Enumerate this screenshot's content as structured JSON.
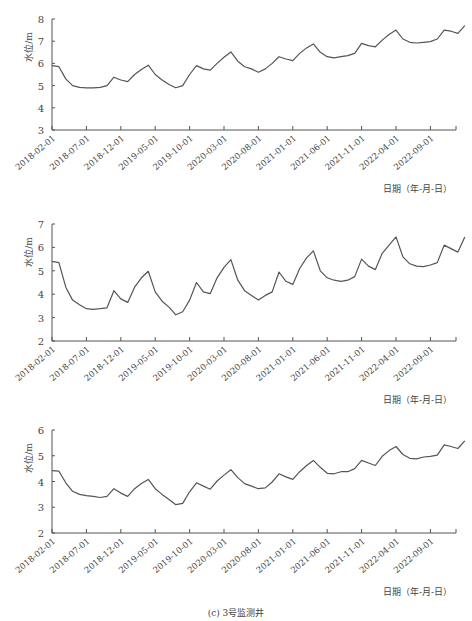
{
  "x_tick_labels": [
    "2018-02-01",
    "2018-07-01",
    "2018-12-01",
    "2019-05-01",
    "2019-10-01",
    "2020-03-01",
    "2020-08-01",
    "2021-01-01",
    "2021-06-01",
    "2021-11-01",
    "2022-04-01",
    "2022-09-01"
  ],
  "x_axis_label": "日期（年-月-日）",
  "y_axis_label": "水位/m",
  "chart_data": [
    {
      "type": "line",
      "title": "(a) 1号监测井",
      "xlabel": "日期（年-月-日）",
      "ylabel": "水位/m",
      "ylim": [
        3,
        8
      ],
      "yticks": [
        3,
        4,
        5,
        6,
        7,
        8
      ],
      "grid": false,
      "x_start": "2018-02",
      "x_step": "1 month",
      "series": [
        {
          "name": "1号监测井",
          "values": [
            5.9,
            5.85,
            5.3,
            5.0,
            4.92,
            4.9,
            4.9,
            4.92,
            5.0,
            5.38,
            5.25,
            5.18,
            5.5,
            5.72,
            5.92,
            5.5,
            5.25,
            5.05,
            4.9,
            5.0,
            5.5,
            5.9,
            5.75,
            5.7,
            6.0,
            6.28,
            6.52,
            6.1,
            5.85,
            5.75,
            5.6,
            5.75,
            6.0,
            6.3,
            6.2,
            6.12,
            6.45,
            6.7,
            6.88,
            6.5,
            6.3,
            6.25,
            6.3,
            6.35,
            6.45,
            6.9,
            6.8,
            6.75,
            7.05,
            7.3,
            7.5,
            7.1,
            6.95,
            6.92,
            6.95,
            6.98,
            7.1,
            7.5,
            7.45,
            7.35,
            7.7
          ]
        }
      ]
    },
    {
      "type": "line",
      "title": "(b) 2号监测井",
      "xlabel": "日期（年-月-日）",
      "ylabel": "水位/m",
      "ylim": [
        2,
        7
      ],
      "yticks": [
        2,
        3,
        4,
        5,
        6,
        7
      ],
      "grid": false,
      "x_start": "2018-02",
      "x_step": "1 month",
      "series": [
        {
          "name": "2号监测井",
          "values": [
            5.4,
            5.35,
            4.3,
            3.75,
            3.55,
            3.38,
            3.35,
            3.38,
            3.42,
            4.15,
            3.8,
            3.65,
            4.3,
            4.7,
            4.98,
            4.1,
            3.7,
            3.45,
            3.12,
            3.25,
            3.75,
            4.5,
            4.1,
            4.02,
            4.7,
            5.15,
            5.48,
            4.6,
            4.15,
            3.95,
            3.75,
            3.95,
            4.1,
            4.95,
            4.55,
            4.42,
            5.1,
            5.55,
            5.85,
            5.0,
            4.7,
            4.6,
            4.55,
            4.6,
            4.75,
            5.5,
            5.2,
            5.05,
            5.75,
            6.1,
            6.45,
            5.6,
            5.3,
            5.2,
            5.18,
            5.25,
            5.35,
            6.1,
            5.95,
            5.8,
            6.45
          ]
        }
      ]
    },
    {
      "type": "line",
      "title": "(c) 3号监测井",
      "xlabel": "日期（年-月-日）",
      "ylabel": "水位/m",
      "ylim": [
        2,
        6
      ],
      "yticks": [
        2,
        3,
        4,
        5,
        6
      ],
      "grid": false,
      "x_start": "2018-02",
      "x_step": "1 month",
      "series": [
        {
          "name": "3号监测井",
          "values": [
            4.42,
            4.4,
            3.95,
            3.62,
            3.5,
            3.45,
            3.42,
            3.38,
            3.42,
            3.72,
            3.55,
            3.42,
            3.72,
            3.92,
            4.08,
            3.72,
            3.5,
            3.3,
            3.1,
            3.15,
            3.6,
            3.95,
            3.82,
            3.7,
            4.02,
            4.25,
            4.46,
            4.15,
            3.92,
            3.82,
            3.72,
            3.75,
            3.98,
            4.3,
            4.18,
            4.08,
            4.38,
            4.62,
            4.82,
            4.55,
            4.32,
            4.3,
            4.38,
            4.38,
            4.5,
            4.82,
            4.72,
            4.62,
            4.98,
            5.2,
            5.36,
            5.05,
            4.9,
            4.88,
            4.95,
            4.98,
            5.02,
            5.42,
            5.36,
            5.28,
            5.58
          ]
        }
      ]
    }
  ]
}
